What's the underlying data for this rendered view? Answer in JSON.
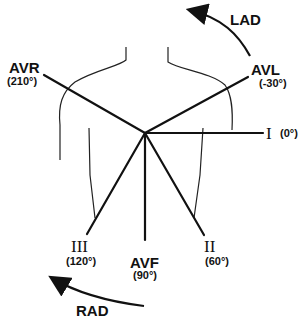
{
  "diagram": {
    "leads": [
      {
        "name": "AVR",
        "angle": "(210°)"
      },
      {
        "name": "AVL",
        "angle": "(-30°)"
      },
      {
        "name": "I",
        "angle": "(0°)"
      },
      {
        "name": "III",
        "angle": "(120°)"
      },
      {
        "name": "AVF",
        "angle": "(90°)"
      },
      {
        "name": "II",
        "angle": "(60°)"
      }
    ],
    "arrows": {
      "lad": "LAD",
      "rad": "RAD"
    }
  }
}
